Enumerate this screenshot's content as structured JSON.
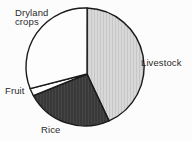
{
  "figure": {
    "kind": "pie-chart-figure",
    "background_color": "#fcfcfc",
    "outline_color": "#1a1a1a",
    "label_color": "#2b2b2b"
  },
  "labels": {
    "dryland": "Dryland\ncrops",
    "livestock": "Livestock",
    "fruit": "Fruit",
    "rice": "Rice"
  },
  "chart_data": {
    "type": "pie",
    "title": "",
    "legend_position": "none",
    "labels_placement": "outside-slices",
    "slices": [
      {
        "label": "Livestock",
        "percent": 43,
        "start_angle_deg": 2,
        "end_angle_deg": 156,
        "color": "#d8d8d8",
        "texture": "stripes-light"
      },
      {
        "label": "Rice",
        "percent": 24,
        "start_angle_deg": 156,
        "end_angle_deg": 241,
        "color": "#393939",
        "texture": "stripes-dark"
      },
      {
        "label": "Fruit",
        "percent": 2,
        "start_angle_deg": 241,
        "end_angle_deg": 248.5,
        "color": "#fdfdfd",
        "texture": "none"
      },
      {
        "label": "Dryland crops",
        "percent": 31,
        "start_angle_deg": 248.5,
        "end_angle_deg": 362,
        "color": "#fdfdfd",
        "texture": "none"
      }
    ]
  }
}
